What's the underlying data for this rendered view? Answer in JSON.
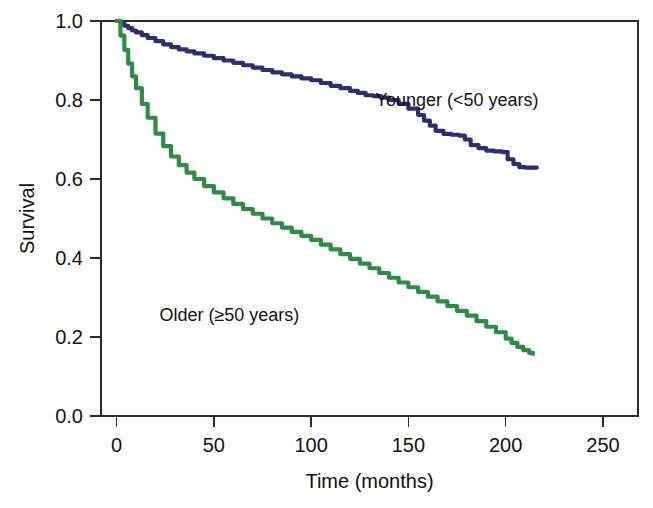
{
  "chart_data": {
    "type": "line",
    "title": "",
    "subtitle": "",
    "xlabel": "Time (months)",
    "ylabel": "Survival",
    "xlim": [
      -8,
      268
    ],
    "ylim": [
      0.0,
      1.0
    ],
    "xticks": [
      0,
      50,
      100,
      150,
      200,
      250
    ],
    "xtick_labels": [
      "0",
      "50",
      "100",
      "150",
      "200",
      "250"
    ],
    "yticks": [
      0.0,
      0.2,
      0.4,
      0.6,
      0.8,
      1.0
    ],
    "ytick_labels": [
      "0.0",
      "0.2",
      "0.4",
      "0.6",
      "0.8",
      "1.0"
    ],
    "grid": false,
    "legend_position": "inline-annotations",
    "frame": "box",
    "series": [
      {
        "name": "Younger (<50 years)",
        "color": "#2b2f6e",
        "annotation": "Younger (<50 years)",
        "annotation_x": 175,
        "annotation_y": 0.8,
        "x": [
          0,
          2,
          4,
          6,
          8,
          10,
          13,
          16,
          20,
          24,
          28,
          32,
          36,
          40,
          45,
          50,
          55,
          60,
          65,
          70,
          75,
          80,
          85,
          90,
          95,
          100,
          105,
          110,
          115,
          120,
          124,
          128,
          132,
          136,
          140,
          145,
          150,
          155,
          158,
          161,
          164,
          168,
          172,
          176,
          179,
          182,
          186,
          190,
          194,
          198,
          201,
          204,
          207,
          210,
          213,
          216
        ],
        "y": [
          1.0,
          0.994,
          0.988,
          0.982,
          0.976,
          0.971,
          0.964,
          0.957,
          0.949,
          0.941,
          0.934,
          0.928,
          0.923,
          0.918,
          0.912,
          0.906,
          0.9,
          0.894,
          0.888,
          0.882,
          0.876,
          0.87,
          0.865,
          0.86,
          0.855,
          0.85,
          0.843,
          0.836,
          0.83,
          0.823,
          0.818,
          0.812,
          0.81,
          0.806,
          0.8,
          0.79,
          0.778,
          0.762,
          0.748,
          0.735,
          0.722,
          0.714,
          0.712,
          0.71,
          0.7,
          0.686,
          0.678,
          0.672,
          0.67,
          0.668,
          0.65,
          0.638,
          0.63,
          0.629,
          0.629,
          0.629
        ]
      },
      {
        "name": "Older (≥50 years)",
        "color": "#2f8b43",
        "annotation": "Older (≥50 years)",
        "annotation_x": 58,
        "annotation_y": 0.255,
        "x": [
          0,
          2,
          4,
          6,
          8,
          10,
          13,
          16,
          20,
          24,
          28,
          32,
          36,
          40,
          45,
          50,
          55,
          60,
          65,
          70,
          75,
          80,
          85,
          90,
          95,
          100,
          105,
          110,
          115,
          120,
          125,
          130,
          135,
          140,
          145,
          150,
          155,
          160,
          165,
          170,
          175,
          180,
          185,
          190,
          195,
          200,
          203,
          206,
          209,
          212,
          214
        ],
        "y": [
          1.0,
          0.963,
          0.927,
          0.892,
          0.86,
          0.83,
          0.79,
          0.755,
          0.715,
          0.683,
          0.657,
          0.635,
          0.616,
          0.6,
          0.582,
          0.566,
          0.551,
          0.537,
          0.524,
          0.512,
          0.5,
          0.488,
          0.477,
          0.466,
          0.456,
          0.446,
          0.434,
          0.422,
          0.41,
          0.398,
          0.386,
          0.374,
          0.362,
          0.35,
          0.338,
          0.326,
          0.314,
          0.302,
          0.29,
          0.278,
          0.266,
          0.254,
          0.24,
          0.226,
          0.212,
          0.196,
          0.185,
          0.175,
          0.167,
          0.16,
          0.157
        ]
      }
    ]
  },
  "figure": {
    "background_color": "#ffffff",
    "axis_color": "#2b2b2b",
    "text_color": "#111111"
  }
}
